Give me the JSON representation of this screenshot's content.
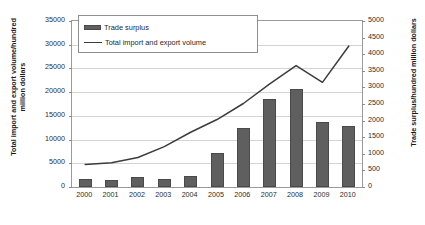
{
  "chart_data": {
    "type": "bar",
    "title": "",
    "categories": [
      "2000",
      "2001",
      "2002",
      "2003",
      "2004",
      "2005",
      "2006",
      "2007",
      "2008",
      "2009",
      "2010"
    ],
    "series": [
      {
        "name": "Trade surplus",
        "type": "bar",
        "axis": "right",
        "unit": "hundred million dollars",
        "values": [
          241,
          226,
          304,
          255,
          320,
          1020,
          1775,
          2640,
          2955,
          1960,
          1830
        ]
      },
      {
        "name": "Total import and export volume",
        "type": "line",
        "axis": "left",
        "unit": "hundred million dollars",
        "values": [
          4743,
          5097,
          6208,
          8510,
          11546,
          14221,
          17604,
          21738,
          25616,
          22072,
          29728
        ]
      }
    ],
    "xlabel": "",
    "ylabel": "Total import and export volume/hundred million dollars",
    "y2label": "Trade surplus/hundred million dollars",
    "ylim": [
      0,
      35000
    ],
    "y2lim": [
      0,
      5000
    ],
    "yticks": [
      "0",
      "5000",
      "10000",
      "15000",
      "20000",
      "25000",
      "30000",
      "35000"
    ],
    "y2ticks": [
      "0",
      "500",
      "1000",
      "1500",
      "2000",
      "2500",
      "3000",
      "3500",
      "4000",
      "4500",
      "5000"
    ],
    "grid": true,
    "legend_position": "top-left",
    "colors": {
      "bar": "#5f5f5f",
      "line": "#3c3c3c",
      "grid": "#d4d4d4",
      "frame": "#9a9a9a",
      "text": "#2b2b2b"
    }
  },
  "legend": {
    "items": [
      {
        "label": "Trade surplus",
        "marker": "bar-swatch"
      },
      {
        "label": "Total import and export volume",
        "marker": "line-swatch"
      }
    ]
  }
}
